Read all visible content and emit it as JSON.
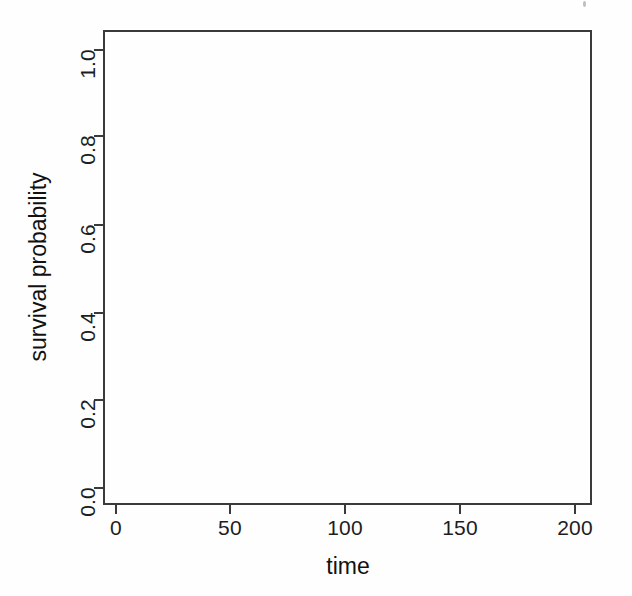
{
  "figure": {
    "width": 632,
    "height": 596,
    "background_color": "#fefefe",
    "axis_color": "#3a3a3a",
    "text_color": "#1d1d1d"
  },
  "chart_data": {
    "type": "line",
    "title": "",
    "subtitle": "",
    "xlabel": "time",
    "ylabel": "survival probability",
    "xlim": [
      -8,
      212
    ],
    "ylim": [
      -0.03,
      1.04
    ],
    "x_ticks": [
      0,
      50,
      100,
      150,
      200
    ],
    "x_tick_labels": [
      "0",
      "50",
      "100",
      "150",
      "200"
    ],
    "y_ticks": [
      0.0,
      0.2,
      0.4,
      0.6,
      0.8,
      1.0
    ],
    "y_tick_labels": [
      "0.0",
      "0.2",
      "0.4",
      "0.6",
      "0.8",
      "1.0"
    ],
    "grid": false,
    "legend": null,
    "legend_position": "none",
    "annotations": [],
    "series": [],
    "note": "Empty plotting frame: axes, ticks and labels are drawn but no data series are plotted inside the box."
  },
  "plot_box": {
    "left_px": 103,
    "top_px": 30,
    "width_px": 489,
    "height_px": 475
  },
  "y_axis": {
    "title": "survival probability",
    "ticks": [
      {
        "label": "1.0",
        "value": 1.0,
        "y_px": 50
      },
      {
        "label": "0.8",
        "value": 0.8,
        "y_px": 136
      },
      {
        "label": "0.6",
        "value": 0.6,
        "y_px": 225
      },
      {
        "label": "0.4",
        "value": 0.4,
        "y_px": 313
      },
      {
        "label": "0.2",
        "value": 0.2,
        "y_px": 400
      },
      {
        "label": "0.0",
        "value": 0.0,
        "y_px": 488
      }
    ]
  },
  "x_axis": {
    "title": "time",
    "ticks": [
      {
        "label": "0",
        "value": 0,
        "x_px": 116
      },
      {
        "label": "50",
        "value": 50,
        "x_px": 230
      },
      {
        "label": "100",
        "value": 100,
        "x_px": 345
      },
      {
        "label": "150",
        "value": 150,
        "x_px": 460
      },
      {
        "label": "200",
        "value": 200,
        "x_px": 575
      }
    ]
  }
}
